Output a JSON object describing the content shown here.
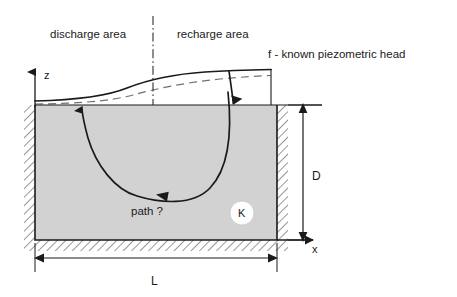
{
  "figure": {
    "title_labels": {
      "discharge_area": "discharge area",
      "recharge_area": "recharge area",
      "piezometric_note": "f - known piezometric head"
    },
    "axes": {
      "vertical_label": "z",
      "horizontal_label": "x"
    },
    "dimensions": {
      "depth_label": "D",
      "length_label": "L"
    },
    "annotations": {
      "flow_path_label": "path ?",
      "conductivity_label": "K"
    },
    "colors": {
      "aquifer_fill": "#d2d2d2",
      "line": "#1a1a1a",
      "text": "#1a1a1a",
      "circle_fill": "#ffffff",
      "background": "#ffffff"
    }
  }
}
